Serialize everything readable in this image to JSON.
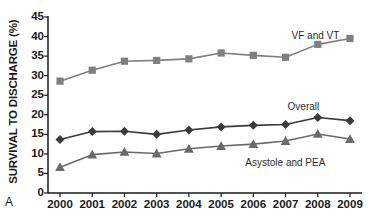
{
  "panel": {
    "letter": "A"
  },
  "axes": {
    "ylabel": "SURVIVAL TO DISCHARGE (%)",
    "xlabel": "",
    "yticks": [
      "0",
      "5",
      "10",
      "15",
      "20",
      "25",
      "30",
      "35",
      "40",
      "45"
    ],
    "xticks": [
      "2000",
      "2001",
      "2002",
      "2003",
      "2004",
      "2005",
      "2006",
      "2007",
      "2008",
      "2009"
    ]
  },
  "annotations": {
    "vf_label": "VF and VT",
    "overall_label": "Overall",
    "asystole_label": "Asystole and PEA"
  },
  "colors": {
    "vf": "#7f7f7f",
    "overall": "#3a3a3a",
    "asystole": "#6a6a6a",
    "axis": "#1a1a1a",
    "background": "#ffffff"
  },
  "chart_data": {
    "type": "line",
    "title": "",
    "xlabel": "",
    "ylabel": "SURVIVAL TO DISCHARGE (%)",
    "x": [
      2000,
      2001,
      2002,
      2003,
      2004,
      2005,
      2006,
      2007,
      2008,
      2009
    ],
    "categories": [
      "2000",
      "2001",
      "2002",
      "2003",
      "2004",
      "2005",
      "2006",
      "2007",
      "2008",
      "2009"
    ],
    "ylim": [
      0,
      45
    ],
    "ytick_step": 5,
    "grid": false,
    "legend": "inline-annotations",
    "series": [
      {
        "name": "VF and VT",
        "marker": "square",
        "color": "#7f7f7f",
        "values": [
          28.6,
          31.4,
          33.7,
          33.9,
          34.3,
          35.8,
          35.2,
          34.7,
          38.0,
          39.5
        ]
      },
      {
        "name": "Overall",
        "marker": "diamond",
        "color": "#3a3a3a",
        "values": [
          13.7,
          15.7,
          15.8,
          15.0,
          16.1,
          16.9,
          17.3,
          17.5,
          19.3,
          18.5
        ]
      },
      {
        "name": "Asystole and PEA",
        "marker": "triangle",
        "color": "#6a6a6a",
        "values": [
          6.6,
          9.8,
          10.5,
          10.1,
          11.3,
          12.0,
          12.5,
          13.3,
          15.1,
          13.8
        ]
      }
    ]
  }
}
